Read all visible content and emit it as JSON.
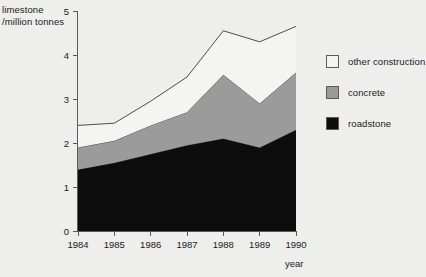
{
  "chart_data": {
    "type": "area",
    "stacked": true,
    "title": "",
    "ylabel": "limestone\n/million tonnes",
    "xlabel": "year",
    "categories": [
      "1984",
      "1985",
      "1986",
      "1987",
      "1988",
      "1989",
      "1990"
    ],
    "x": [
      1984,
      1985,
      1986,
      1987,
      1988,
      1989,
      1990
    ],
    "ylim": [
      0,
      5
    ],
    "yticks": [
      0,
      1,
      2,
      3,
      4,
      5
    ],
    "ytick_labels": [
      "0",
      "1",
      "2",
      "3",
      "4",
      "5"
    ],
    "xlim": [
      1984,
      1990
    ],
    "grid": false,
    "legend_position": "right",
    "series": [
      {
        "name": "roadstone",
        "color": "#0d0d0d",
        "values": [
          1.4,
          1.55,
          1.75,
          1.95,
          2.1,
          1.9,
          2.3
        ]
      },
      {
        "name": "concrete",
        "color": "#9b9b9b",
        "values": [
          0.5,
          0.5,
          0.65,
          0.75,
          1.45,
          1.0,
          1.3
        ]
      },
      {
        "name": "other construction",
        "color": "#f4f4f2",
        "values": [
          0.5,
          0.4,
          0.55,
          0.8,
          1.0,
          1.4,
          1.05
        ]
      }
    ],
    "cumulative_totals": {
      "roadstone_top": [
        1.4,
        1.55,
        1.75,
        1.95,
        2.1,
        1.9,
        2.3
      ],
      "concrete_top": [
        1.9,
        2.05,
        2.4,
        2.7,
        3.55,
        2.9,
        3.6
      ],
      "total_top": [
        2.4,
        2.45,
        2.95,
        3.5,
        4.55,
        4.3,
        4.65
      ]
    }
  },
  "legend": {
    "items": [
      {
        "label": "other construction",
        "color": "#f4f4f2"
      },
      {
        "label": "concrete",
        "color": "#9b9b9b"
      },
      {
        "label": "roadstone",
        "color": "#0d0d0d"
      }
    ]
  },
  "axes": {
    "y_title": "limestone\n/million tonnes",
    "x_title": "year"
  }
}
